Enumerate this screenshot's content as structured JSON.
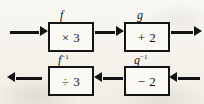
{
  "diagram": {
    "type": "function-machine",
    "background_color": "#f3f0e8",
    "ink_color": "#131313",
    "rows": [
      {
        "name": "forward",
        "direction": "left-to-right",
        "machines": [
          {
            "label": "f",
            "label_text": "f",
            "operation": "× 3",
            "operation_plain": "multiply by 3"
          },
          {
            "label": "g",
            "label_text": "g",
            "operation": "+ 2",
            "operation_plain": "add 2"
          }
        ]
      },
      {
        "name": "inverse",
        "direction": "right-to-left",
        "machines": [
          {
            "label": "f-inverse",
            "label_base": "f",
            "label_sup": "−1",
            "operation": "÷ 3",
            "operation_plain": "divide by 3"
          },
          {
            "label": "g-inverse",
            "label_base": "g",
            "label_sup": "−1",
            "operation": "− 2",
            "operation_plain": "subtract 2"
          }
        ]
      }
    ],
    "arrows": {
      "top_input": "input-arrow-right",
      "top_middle": "link-arrow-right",
      "top_output": "output-arrow-right",
      "bottom_input": "input-arrow-left",
      "bottom_middle": "link-arrow-left",
      "bottom_output": "output-arrow-left"
    },
    "watermark": ""
  }
}
